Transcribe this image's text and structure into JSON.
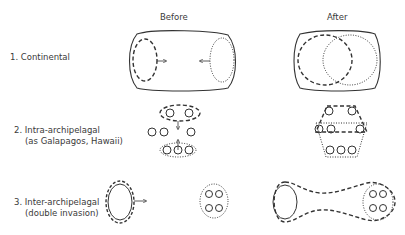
{
  "headers": {
    "before": "Before",
    "after": "After"
  },
  "rows": [
    {
      "label": "1. Continental",
      "sublabel": ""
    },
    {
      "label": "2. Intra-archipelagal",
      "sublabel": "(as Galapagos, Hawaii)"
    },
    {
      "label": "3. Inter-archipelagal",
      "sublabel": "(double invasion)"
    }
  ],
  "legend_styles": {
    "dashed": "source population range",
    "dotted": "invading population range",
    "solid": "landmass / island"
  },
  "colors": {
    "stroke": "#333333",
    "background": "#ffffff"
  }
}
